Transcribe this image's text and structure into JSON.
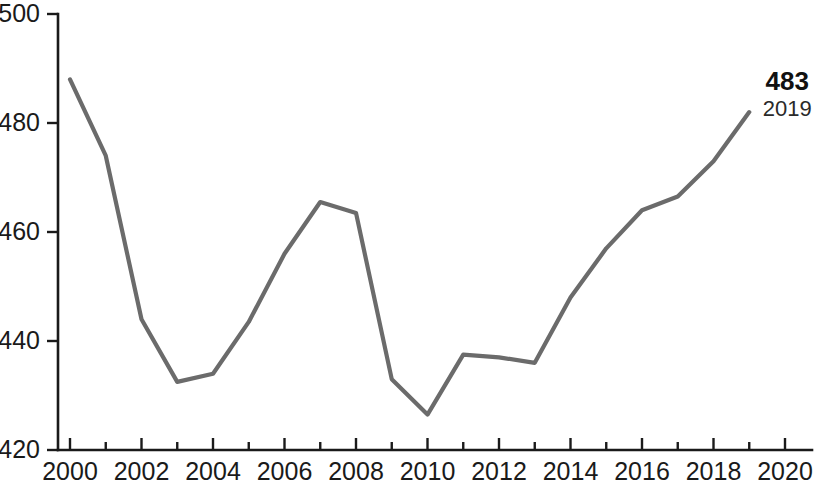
{
  "chart_data": {
    "type": "line",
    "title": "",
    "subtitle": "",
    "xlabel": "",
    "ylabel": "",
    "x": [
      2000,
      2001,
      2002,
      2003,
      2004,
      2005,
      2006,
      2007,
      2008,
      2009,
      2010,
      2011,
      2012,
      2013,
      2014,
      2015,
      2016,
      2017,
      2018,
      2019
    ],
    "values": [
      488,
      474,
      444,
      432.5,
      434,
      443.5,
      456,
      465.5,
      463.5,
      433,
      426.5,
      437.5,
      437,
      436,
      448,
      457,
      464,
      466.5,
      473,
      482
    ],
    "series": [
      {
        "name": "series-1",
        "values": [
          488,
          474,
          444,
          432.5,
          434,
          443.5,
          456,
          465.5,
          463.5,
          433,
          426.5,
          437.5,
          437,
          436,
          448,
          457,
          464,
          466.5,
          473,
          482
        ]
      }
    ],
    "xlim": [
      2000,
      2020
    ],
    "ylim": [
      420,
      500
    ],
    "x_ticks": [
      2000,
      2002,
      2004,
      2006,
      2008,
      2010,
      2012,
      2014,
      2016,
      2018,
      2020
    ],
    "x_tick_labels": [
      "2000",
      "2002",
      "2004",
      "2006",
      "2008",
      "2010",
      "2012",
      "2014",
      "2016",
      "2018",
      "2020"
    ],
    "x_minor_ticks": [
      2001,
      2003,
      2005,
      2007,
      2009,
      2011,
      2013,
      2015,
      2017,
      2019
    ],
    "y_ticks": [
      420,
      440,
      460,
      480,
      500
    ],
    "y_tick_labels": [
      "420",
      "440",
      "460",
      "480",
      "500"
    ],
    "grid": false,
    "legend": null,
    "legend_position": "none",
    "line_color": "#6b6b6b",
    "axis_color": "#1a1a1a",
    "background": "#ffffff",
    "annotations": [
      {
        "name": "endpoint-label",
        "value_text": "483",
        "year_text": "2019",
        "at_x": 2019,
        "at_y": 482
      }
    ]
  }
}
